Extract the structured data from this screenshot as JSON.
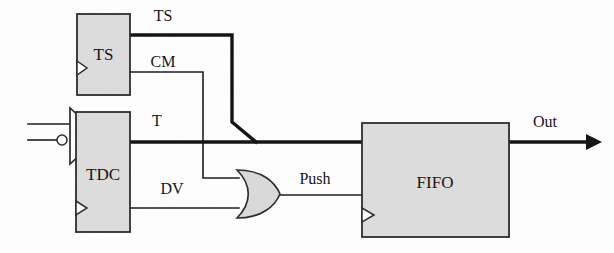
{
  "figure": {
    "kind": "block-schematic",
    "background_color": "#ffffff",
    "line_color": "#111111",
    "block_fill_color": "#dddddd",
    "gate_fill_color": "#dadada"
  },
  "blocks": {
    "ts": {
      "label": "TS",
      "x": 77,
      "y": 14,
      "width": 53,
      "height": 81
    },
    "tdc": {
      "label": "TDC",
      "x": 76,
      "y": 112,
      "width": 54,
      "height": 120
    },
    "fifo": {
      "label": "FIFO",
      "x": 362,
      "y": 123,
      "width": 147,
      "height": 114
    }
  },
  "gates": {
    "or_gate": {
      "name": "or-gate",
      "x": 235,
      "y": 170,
      "width": 45,
      "height": 48
    },
    "input_amplifier": {
      "name": "comparator",
      "x": 68,
      "y": 108,
      "width": 30,
      "height": 56
    }
  },
  "signals": {
    "ts_bus": {
      "label": "TS",
      "label_x": 163,
      "label_y": 17,
      "weight": "thick"
    },
    "cm": {
      "label": "CM",
      "label_x": 163,
      "label_y": 63,
      "weight": "thin"
    },
    "t_bus": {
      "label": "T",
      "label_x": 157,
      "label_y": 122,
      "weight": "thick"
    },
    "dv": {
      "label": "DV",
      "label_x": 172,
      "label_y": 190,
      "weight": "thin"
    },
    "push": {
      "label": "Push",
      "label_x": 315,
      "label_y": 180,
      "weight": "thin"
    },
    "out": {
      "label": "Out",
      "label_x": 545,
      "label_y": 123,
      "weight": "thick"
    }
  }
}
